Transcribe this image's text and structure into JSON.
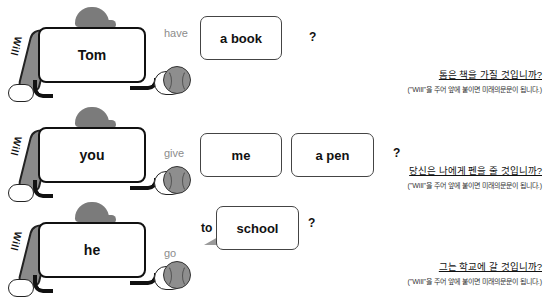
{
  "mascot": {
    "bat_label": "Will"
  },
  "rows": [
    {
      "subject": "Tom",
      "verb": "have",
      "words": [
        "a book"
      ],
      "question_mark": "?",
      "translation": "톰은 책을 가질 것입니까?",
      "note": "(\"Will\"을 주어 앞에 붙이면 미래의문문이 됩니다.)"
    },
    {
      "subject": "you",
      "verb": "give",
      "words": [
        "me",
        "a pen"
      ],
      "question_mark": "?",
      "translation": "당신은 나에게 펜을 줄 것입니까?",
      "note": "(\"Will\"을 주어 앞에 붙이면 미래의문문이 됩니다.)"
    },
    {
      "subject": "he",
      "verb": "go",
      "preposition": "to",
      "words": [
        "school"
      ],
      "question_mark": "?",
      "translation": "그는 학교에 갈 것입니까?",
      "note": "(\"Will\"을 주어 앞에 붙이면 미래의문문이 됩니다.)"
    }
  ],
  "colors": {
    "verb_text": "#8c8c8c",
    "cap": "#7b7b7b",
    "bat": "#8a8a8a",
    "ball": "#8e8e8e"
  }
}
